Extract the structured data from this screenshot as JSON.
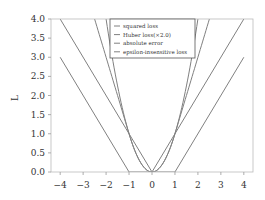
{
  "chart_data": {
    "type": "line",
    "title": "",
    "xlabel": "",
    "ylabel": "L",
    "xlim": [
      -4.4,
      4.4
    ],
    "ylim": [
      0,
      4
    ],
    "xticks": [
      -4,
      -3,
      -2,
      -1,
      0,
      1,
      2,
      3,
      4
    ],
    "xtick_labels": [
      "−4",
      "−3",
      "−2",
      "−1",
      "0",
      "1",
      "2",
      "3",
      "4"
    ],
    "yticks": [
      0,
      0.5,
      1,
      1.5,
      2,
      2.5,
      3,
      3.5,
      4
    ],
    "ytick_labels": [
      "0.0",
      "0.5",
      "1.0",
      "1.5",
      "2.0",
      "2.5",
      "3.0",
      "3.5",
      "4.0"
    ],
    "grid": false,
    "legend_position": "top-center",
    "line_color": "#808080",
    "series": [
      {
        "name": "squared loss",
        "x": [
          -4,
          -3,
          -2,
          -1.5,
          -1,
          -0.5,
          0,
          0.5,
          1,
          1.5,
          2,
          3,
          4
        ],
        "values": [
          16,
          9,
          4,
          2.25,
          1,
          0.25,
          0,
          0.25,
          1,
          2.25,
          4,
          9,
          16
        ]
      },
      {
        "name": "Huber loss(×2.0)",
        "x": [
          -4,
          -3,
          -2,
          -1,
          -0.5,
          0,
          0.5,
          1,
          2,
          3,
          4
        ],
        "values": [
          7,
          5,
          3,
          1,
          0.25,
          0,
          0.25,
          1,
          3,
          5,
          7
        ]
      },
      {
        "name": "absolute error",
        "x": [
          -4,
          0,
          4
        ],
        "values": [
          4,
          0,
          4
        ]
      },
      {
        "name": "epsilon-insensitive loss",
        "x": [
          -4,
          -1,
          1,
          4
        ],
        "values": [
          3,
          0,
          0,
          3
        ]
      }
    ]
  }
}
